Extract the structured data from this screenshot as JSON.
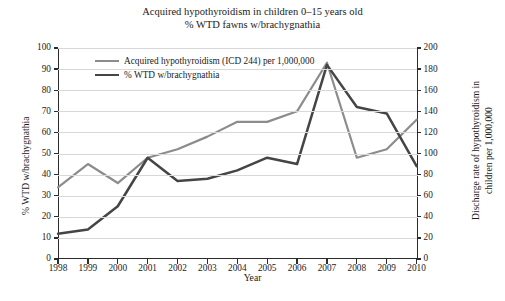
{
  "chart_data": {
    "type": "line",
    "title": "Acquired hypothyroidism in children 0–15 years old\n% WTD fawns w/brachygnathia",
    "title_line1": "Acquired hypothyroidism in children 0–15 years old",
    "title_line2": "% WTD fawns w/brachygnathia",
    "xlabel": "Year",
    "ylabel": "% WTD w/brachygnathia",
    "ylabel_right_line1": "Discharge rate of hypothyroidism in",
    "ylabel_right_line2": "children per 1,000,000",
    "categories": [
      1998,
      1999,
      2000,
      2001,
      2002,
      2003,
      2004,
      2005,
      2006,
      2007,
      2008,
      2009,
      2010
    ],
    "x_tick_labels": [
      "1998",
      "1999",
      "2000",
      "2001",
      "2002",
      "2003",
      "2004",
      "2005",
      "2006",
      "2007",
      "2008",
      "2009",
      "2010"
    ],
    "ylim": [
      0,
      100
    ],
    "y_tick_labels": [
      "0",
      "10",
      "20",
      "30",
      "40",
      "50",
      "60",
      "70",
      "80",
      "90",
      "100"
    ],
    "ylim_right": [
      0,
      200
    ],
    "y_tick_labels_right": [
      "0",
      "20",
      "40",
      "60",
      "80",
      "100",
      "120",
      "140",
      "160",
      "180",
      "200"
    ],
    "grid": true,
    "legend_position": "top-left-inside",
    "series": [
      {
        "name": "Acquired hypothyroidism (ICD 244) per 1,000,000",
        "axis": "right",
        "color": "#8c8c8c",
        "values_right_axis": [
          68,
          90,
          72,
          96,
          104,
          116,
          130,
          130,
          140,
          186,
          96,
          104,
          132
        ],
        "values": [
          34,
          45,
          36,
          48,
          52,
          58,
          65,
          65,
          70,
          93,
          48,
          52,
          66
        ]
      },
      {
        "name": "% WTD w/brachygnathia",
        "axis": "left",
        "color": "#454545",
        "values": [
          12,
          14,
          25,
          48,
          37,
          38,
          42,
          48,
          45,
          92,
          72,
          69,
          44
        ]
      }
    ]
  }
}
